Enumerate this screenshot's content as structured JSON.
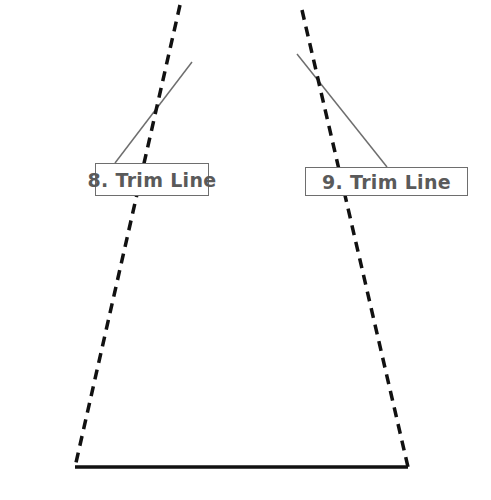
{
  "diagram": {
    "labels": [
      {
        "id": "8",
        "text": "8. Trim Line"
      },
      {
        "id": "9",
        "text": "9. Trim Line"
      }
    ],
    "colors": {
      "cut_line": "#111111",
      "leader_line": "#6e6e6e",
      "label_text": "#5a5a5a",
      "label_border": "#6e6e6e",
      "background": "#ffffff"
    },
    "lines": {
      "left_trim": {
        "x1": 180,
        "y1": 5,
        "x2": 75,
        "y2": 467,
        "style": "dashed"
      },
      "right_trim": {
        "x1": 302,
        "y1": 10,
        "x2": 408,
        "y2": 467,
        "style": "dashed"
      },
      "base": {
        "x1": 75,
        "y1": 467,
        "x2": 408,
        "y2": 467,
        "style": "solid"
      },
      "leader_8": {
        "x1": 115,
        "y1": 163,
        "x2": 192,
        "y2": 62
      },
      "leader_9": {
        "x1": 387,
        "y1": 167,
        "x2": 297,
        "y2": 54
      }
    }
  }
}
